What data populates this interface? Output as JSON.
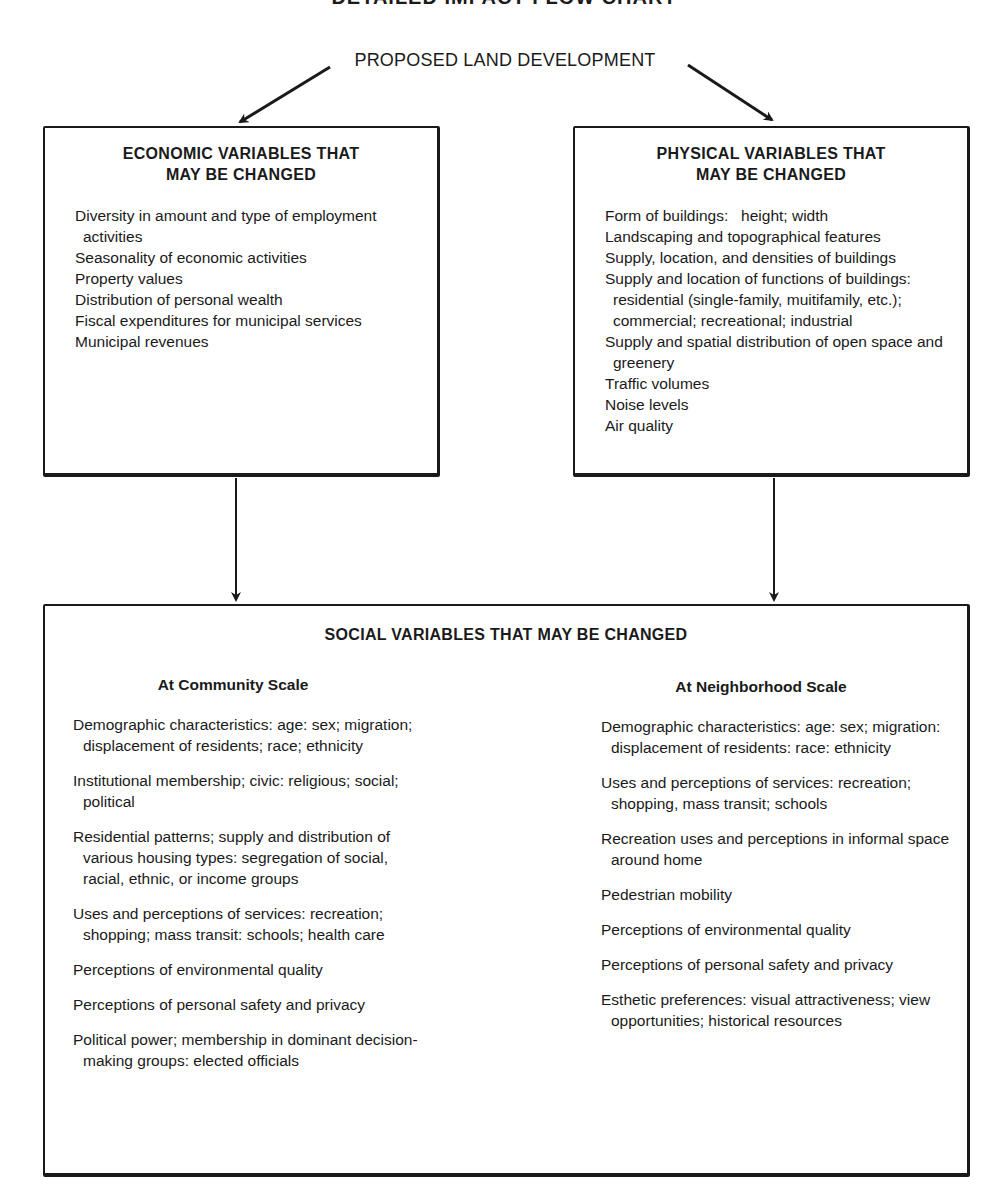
{
  "chart_title": "DETAILED IMPACT FLOW CHART",
  "root": {
    "label": "PROPOSED LAND DEVELOPMENT"
  },
  "economic": {
    "heading": "ECONOMIC VARIABLES THAT MAY BE CHANGED",
    "items": [
      "Diversity in amount and type of employment activities",
      "Seasonality of economic activities",
      "Property values",
      "Distribution of personal wealth",
      "Fiscal expenditures for municipal services",
      "Municipal revenues"
    ]
  },
  "physical": {
    "heading": "PHYSICAL VARIABLES THAT MAY BE CHANGED",
    "items": [
      "Form of buildings:   height; width",
      "Landscaping and topographical features",
      "Supply, location, and densities of buildings",
      "Supply and location of functions of buildings: residential (single-family, muitifamily, etc.); commercial; recreational; industrial",
      "Supply and spatial distribution of open space and greenery",
      "Traffic volumes",
      "Noise levels",
      "Air quality"
    ]
  },
  "social": {
    "heading": "SOCIAL VARIABLES THAT MAY BE CHANGED",
    "community": {
      "heading": "At Community Scale",
      "items": [
        "Demographic characteristics: age: sex; migration; displacement of residents; race; ethnicity",
        "Institutional membership; civic: religious; social; political",
        "Residential patterns; supply and distribution of various housing types: segregation of social, racial, ethnic, or income groups",
        "Uses and perceptions of services: recreation; shopping; mass transit: schools; health care",
        "Perceptions of environmental quality",
        "Perceptions of personal safety and privacy",
        "Political power; membership in dominant decision-making groups: elected officials"
      ]
    },
    "neighborhood": {
      "heading": "At Neighborhood Scale",
      "items": [
        "Demographic characteristics: age: sex; migration: displacement of residents: race: ethnicity",
        "Uses and perceptions of services: recreation; shopping, mass transit; schools",
        "Recreation uses and perceptions in informal space around home",
        "Pedestrian mobility",
        "Perceptions of environmental quality",
        "Perceptions of personal safety and privacy",
        "Esthetic preferences: visual attractiveness; view opportunities; historical resources"
      ]
    }
  },
  "colors": {
    "ink": "#1a1a1a",
    "paper": "#ffffff"
  }
}
